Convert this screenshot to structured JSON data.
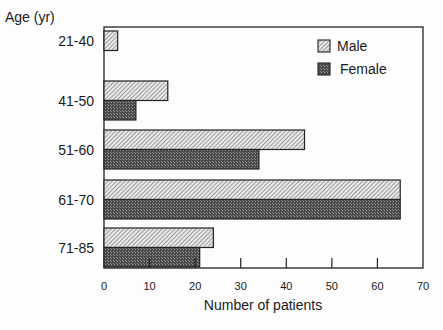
{
  "chart_data": {
    "type": "bar",
    "orientation": "horizontal",
    "title": "",
    "ylabel": "Age (yr)",
    "xlabel": "Number of patients",
    "categories": [
      "21-40",
      "41-50",
      "51-60",
      "61-70",
      "71-85"
    ],
    "series": [
      {
        "name": "Male",
        "values": [
          3,
          14,
          44,
          65,
          24
        ],
        "fill": "hatched-light",
        "color": "#cfcfcf"
      },
      {
        "name": "Female",
        "values": [
          0,
          7,
          34,
          65,
          21
        ],
        "fill": "crosshatch-dark",
        "color": "#5a5a5a"
      }
    ],
    "xlim": [
      0,
      70
    ],
    "xticks": [
      "0",
      "10",
      "20",
      "30",
      "40",
      "50",
      "60",
      "70"
    ],
    "grid": false,
    "legend_position": "upper right inside"
  }
}
